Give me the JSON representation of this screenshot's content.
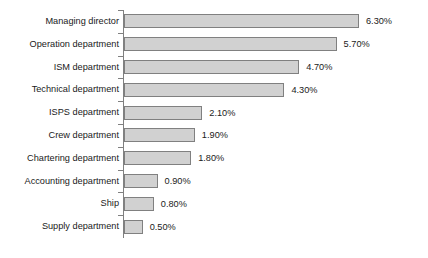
{
  "chart_data": {
    "type": "bar",
    "orientation": "horizontal",
    "title": "",
    "subtitle": "",
    "xlabel": "",
    "ylabel": "",
    "xlim": [
      0,
      6.3
    ],
    "grid": false,
    "legend": false,
    "value_suffix": "%",
    "categories": [
      "Managing director",
      "Operation department",
      "ISM department",
      "Technical department",
      "ISPS department",
      "Crew department",
      "Chartering department",
      "Accounting department",
      "Ship",
      "Supply department"
    ],
    "values": [
      6.3,
      5.7,
      4.7,
      4.3,
      2.1,
      1.9,
      1.8,
      0.9,
      0.8,
      0.5
    ],
    "data_labels": [
      "6.30%",
      "5.70%",
      "4.70%",
      "4.30%",
      "2.10%",
      "1.90%",
      "1.80%",
      "0.90%",
      "0.80%",
      "0.50%"
    ],
    "colors": {
      "bar_fill": "#d1d1d1",
      "bar_border": "#808080",
      "axis": "#808080",
      "text": "#1a1a1a",
      "background": "#ffffff"
    }
  }
}
